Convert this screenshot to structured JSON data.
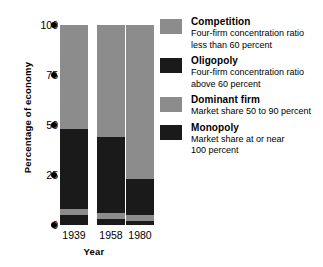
{
  "chart_data": {
    "type": "bar",
    "subtype": "stacked-vertical-100pct",
    "title": "",
    "xlabel": "Year",
    "ylabel": "Percentage of economy",
    "categories": [
      "1939",
      "1958",
      "1980"
    ],
    "ylim": [
      0,
      100
    ],
    "yticks": [
      0,
      25,
      50,
      75,
      100
    ],
    "ytick_labels": [
      "0",
      "25",
      "50",
      "75",
      "100"
    ],
    "grid": false,
    "legend_position": "right",
    "series": [
      {
        "name": "Competition",
        "color": "#8c8c8c",
        "values": [
          52,
          56,
          77
        ]
      },
      {
        "name": "Oligopoly",
        "color": "#1a1a1a",
        "values": [
          40,
          38,
          18
        ]
      },
      {
        "name": "Dominant firm",
        "color": "#8c8c8c",
        "values": [
          3,
          3,
          3
        ]
      },
      {
        "name": "Monopoly",
        "color": "#1a1a1a",
        "values": [
          5,
          3,
          2
        ]
      }
    ],
    "stack_order_bottom_to_top": [
      "Monopoly",
      "Dominant firm",
      "Oligopoly",
      "Competition"
    ],
    "annotations": []
  },
  "axes": {
    "y_label": "Percentage of economy",
    "x_label": "Year",
    "y_ticks": [
      {
        "label": "100",
        "value": 100
      },
      {
        "label": "75",
        "value": 75
      },
      {
        "label": "50",
        "value": 50
      },
      {
        "label": "25",
        "value": 25
      },
      {
        "label": "0",
        "value": 0
      }
    ],
    "x_ticks": [
      "1939",
      "1958",
      "1980"
    ]
  },
  "legend": {
    "items": [
      {
        "title": "Competition",
        "desc_line1": "Four-firm concentration ratio",
        "desc_line2": "less than 60 percent",
        "color": "#8c8c8c"
      },
      {
        "title": "Oligopoly",
        "desc_line1": "Four-firm concentration ratio",
        "desc_line2": "above 60 percent",
        "color": "#1a1a1a"
      },
      {
        "title": "Dominant firm",
        "desc_line1": "Market share 50 to 90 percent",
        "desc_line2": "",
        "color": "#8c8c8c"
      },
      {
        "title": "Monopoly",
        "desc_line1": "Market share at or near",
        "desc_line2": "100 percent",
        "color": "#1a1a1a"
      }
    ]
  },
  "colors": {
    "light_gray": "#8c8c8c",
    "dark": "#1a1a1a",
    "background": "#ffffff",
    "text": "#000000"
  }
}
